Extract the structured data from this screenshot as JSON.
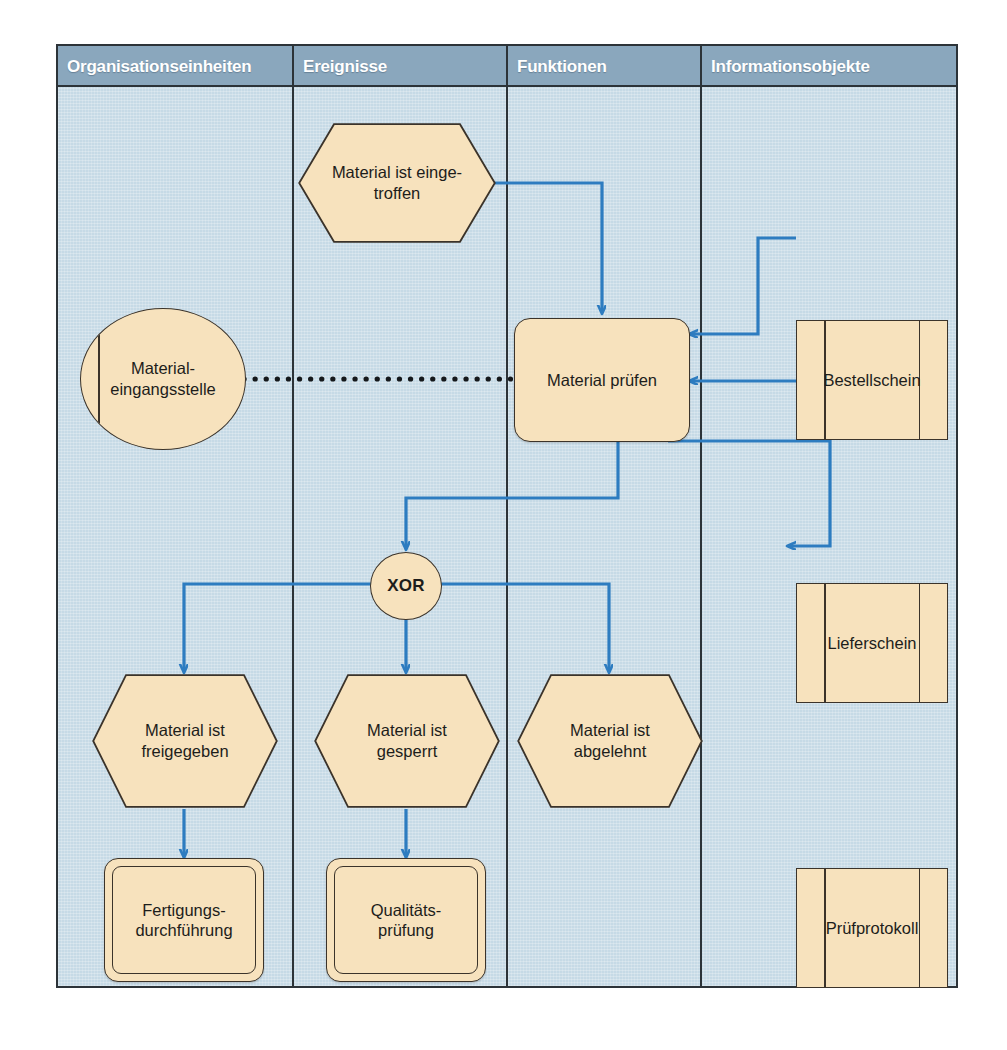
{
  "diagram": {
    "colors": {
      "panel_background": "#c6dae6",
      "header_background": "#8aa7bd",
      "header_text": "#ffffff",
      "node_fill": "#f7e2bd",
      "node_border": "#3b332a",
      "edge": "#2d7cc0",
      "frame": "#2c3338"
    },
    "columns": [
      {
        "label": "Organisationseinheiten"
      },
      {
        "label": "Ereignisse"
      },
      {
        "label": "Funktionen"
      },
      {
        "label": "Informationsobjekte"
      }
    ],
    "nodes": {
      "event_material_eingetroffen": {
        "label": "Material ist einge-\ntroffen",
        "type": "event",
        "column": "Ereignisse"
      },
      "org_materialeingangsstelle": {
        "label": "Material-\neingangsstelle",
        "type": "organizational-unit",
        "column": "Organisationseinheiten"
      },
      "function_material_pruefen": {
        "label": "Material prüfen",
        "type": "function",
        "column": "Funktionen"
      },
      "info_bestellschein": {
        "label": "Bestellschein",
        "type": "information-object",
        "column": "Informationsobjekte"
      },
      "info_lieferschein": {
        "label": "Lieferschein",
        "type": "information-object",
        "column": "Informationsobjekte"
      },
      "info_pruefprotokoll": {
        "label": "Prüfprotokoll",
        "type": "information-object",
        "column": "Informationsobjekte"
      },
      "connector_xor": {
        "label": "XOR",
        "type": "connector",
        "column": "Ereignisse"
      },
      "event_freigegeben": {
        "label": "Material ist\nfreigegeben",
        "type": "event",
        "column": "Organisationseinheiten"
      },
      "event_gesperrt": {
        "label": "Material ist\ngesperrt",
        "type": "event",
        "column": "Ereignisse"
      },
      "event_abgelehnt": {
        "label": "Material ist\nabgelehnt",
        "type": "event",
        "column": "Funktionen"
      },
      "procif_fertigungsdurchfuehrung": {
        "label": "Fertigungs-\ndurchführung",
        "type": "process-interface",
        "column": "Organisationseinheiten"
      },
      "procif_qualitaetspruefung": {
        "label": "Qualitäts-\nprüfung",
        "type": "process-interface",
        "column": "Ereignisse"
      }
    },
    "edges": [
      {
        "from": "event_material_eingetroffen",
        "to": "function_material_pruefen",
        "style": "solid-arrow"
      },
      {
        "from": "org_materialeingangsstelle",
        "to": "function_material_pruefen",
        "style": "dotted"
      },
      {
        "from": "info_bestellschein",
        "to": "function_material_pruefen",
        "style": "solid-arrow"
      },
      {
        "from": "info_lieferschein",
        "to": "function_material_pruefen",
        "style": "solid-arrow"
      },
      {
        "from": "function_material_pruefen",
        "to": "info_pruefprotokoll",
        "style": "solid-arrow"
      },
      {
        "from": "function_material_pruefen",
        "to": "connector_xor",
        "style": "solid-arrow"
      },
      {
        "from": "connector_xor",
        "to": "event_freigegeben",
        "style": "solid-arrow"
      },
      {
        "from": "connector_xor",
        "to": "event_gesperrt",
        "style": "solid-arrow"
      },
      {
        "from": "connector_xor",
        "to": "event_abgelehnt",
        "style": "solid-arrow"
      },
      {
        "from": "event_freigegeben",
        "to": "procif_fertigungsdurchfuehrung",
        "style": "solid-arrow"
      },
      {
        "from": "event_gesperrt",
        "to": "procif_qualitaetspruefung",
        "style": "solid-arrow"
      }
    ]
  }
}
